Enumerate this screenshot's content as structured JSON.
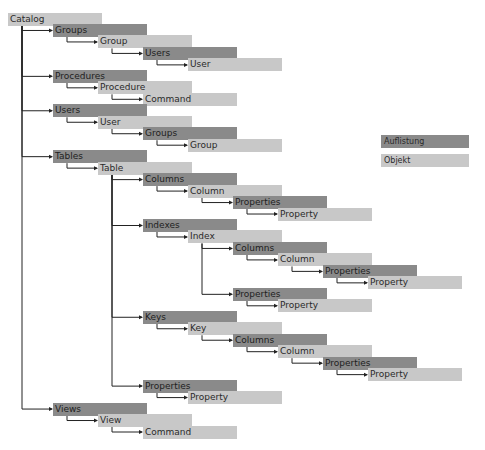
{
  "legend": {
    "collection_label": "Auflistung",
    "object_label": "Objekt",
    "collection_color": "#8a8a8a",
    "object_color": "#c8c8c8"
  },
  "nodes": [
    {
      "label": "Catalog",
      "type": "object",
      "level": 0,
      "row": 0
    },
    {
      "label": "Groups",
      "type": "collection",
      "level": 1,
      "row": 1
    },
    {
      "label": "Group",
      "type": "object",
      "level": 2,
      "row": 2
    },
    {
      "label": "Users",
      "type": "collection",
      "level": 3,
      "row": 3
    },
    {
      "label": "User",
      "type": "object",
      "level": 4,
      "row": 4
    },
    {
      "label": "Procedures",
      "type": "collection",
      "level": 1,
      "row": 5
    },
    {
      "label": "Procedure",
      "type": "object",
      "level": 2,
      "row": 6
    },
    {
      "label": "Command",
      "type": "object",
      "level": 3,
      "row": 7
    },
    {
      "label": "Users",
      "type": "collection",
      "level": 1,
      "row": 8
    },
    {
      "label": "User",
      "type": "object",
      "level": 2,
      "row": 9
    },
    {
      "label": "Groups",
      "type": "collection",
      "level": 3,
      "row": 10
    },
    {
      "label": "Group",
      "type": "object",
      "level": 4,
      "row": 11
    },
    {
      "label": "Tables",
      "type": "collection",
      "level": 1,
      "row": 12
    },
    {
      "label": "Table",
      "type": "object",
      "level": 2,
      "row": 13
    },
    {
      "label": "Columns",
      "type": "collection",
      "level": 3,
      "row": 14
    },
    {
      "label": "Column",
      "type": "object",
      "level": 4,
      "row": 15
    },
    {
      "label": "Properties",
      "type": "collection",
      "level": 5,
      "row": 16
    },
    {
      "label": "Property",
      "type": "object",
      "level": 6,
      "row": 17
    },
    {
      "label": "Indexes",
      "type": "collection",
      "level": 3,
      "row": 18
    },
    {
      "label": "Index",
      "type": "object",
      "level": 4,
      "row": 19
    },
    {
      "label": "Columns",
      "type": "collection",
      "level": 5,
      "row": 20
    },
    {
      "label": "Column",
      "type": "object",
      "level": 6,
      "row": 21
    },
    {
      "label": "Properties",
      "type": "collection",
      "level": 7,
      "row": 22
    },
    {
      "label": "Property",
      "type": "object",
      "level": 8,
      "row": 23
    },
    {
      "label": "Properties",
      "type": "collection",
      "level": 5,
      "row": 24
    },
    {
      "label": "Property",
      "type": "object",
      "level": 6,
      "row": 25
    },
    {
      "label": "Keys",
      "type": "collection",
      "level": 3,
      "row": 26
    },
    {
      "label": "Key",
      "type": "object",
      "level": 4,
      "row": 27
    },
    {
      "label": "Columns",
      "type": "collection",
      "level": 5,
      "row": 28
    },
    {
      "label": "Column",
      "type": "object",
      "level": 6,
      "row": 29
    },
    {
      "label": "Properties",
      "type": "collection",
      "level": 7,
      "row": 30
    },
    {
      "label": "Property",
      "type": "object",
      "level": 8,
      "row": 31
    },
    {
      "label": "Properties",
      "type": "collection",
      "level": 3,
      "row": 32
    },
    {
      "label": "Property",
      "type": "object",
      "level": 4,
      "row": 33
    },
    {
      "label": "Views",
      "type": "collection",
      "level": 1,
      "row": 34
    },
    {
      "label": "View",
      "type": "object",
      "level": 2,
      "row": 35
    },
    {
      "label": "Command",
      "type": "object",
      "level": 3,
      "row": 36
    }
  ]
}
